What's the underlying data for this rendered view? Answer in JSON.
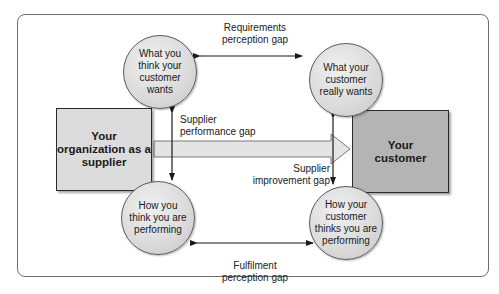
{
  "diagram": {
    "nodes": {
      "left_box": "Your organization as a supplier",
      "right_box": "Your customer",
      "circle_top_left": "What you think your customer wants",
      "circle_top_right": "What your customer really wants",
      "circle_bottom_left": "How you think you are performing",
      "circle_bottom_right": "How your customer thinks you are performing"
    },
    "gaps": {
      "requirements": "Requirements\nperception gap",
      "fulfilment": "Fulfilment\nperception gap",
      "performance": "Supplier\nperformance gap",
      "improvement": "Supplier\nimprovement gap"
    },
    "colors": {
      "left_box_fill": "#dcdcdc",
      "right_box_fill": "#b4b4b4",
      "arrow_fill": "#e4e4e4",
      "line": "#1a1a1a"
    }
  }
}
